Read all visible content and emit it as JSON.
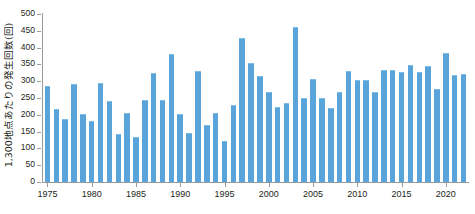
{
  "chart_data": {
    "type": "bar",
    "title": "",
    "subtitle": "",
    "xlabel": "",
    "ylabel": "1,300地点あたりの発生回数(回)",
    "ylim": [
      0,
      500
    ],
    "y_ticks": [
      0,
      50,
      100,
      150,
      200,
      250,
      300,
      350,
      400,
      450,
      500
    ],
    "x_tick_labels": [
      "1975",
      "1980",
      "1985",
      "1990",
      "1995",
      "2000",
      "2005",
      "2010",
      "2015",
      "2020"
    ],
    "grid": false,
    "legend": "none",
    "bar_color": "#5aa4dc",
    "axis_color": "#9a9a9a",
    "text_color": "#231f20",
    "categories": [
      "1975",
      "1976",
      "1977",
      "1978",
      "1979",
      "1980",
      "1981",
      "1982",
      "1983",
      "1984",
      "1985",
      "1986",
      "1987",
      "1988",
      "1989",
      "1990",
      "1991",
      "1992",
      "1993",
      "1994",
      "1995",
      "1996",
      "1997",
      "1998",
      "1999",
      "2000",
      "2001",
      "2002",
      "2003",
      "2004",
      "2005",
      "2006",
      "2007",
      "2008",
      "2009",
      "2010",
      "2011",
      "2012",
      "2013",
      "2014",
      "2015",
      "2016",
      "2017",
      "2018",
      "2019",
      "2020",
      "2021",
      "2022"
    ],
    "values": [
      285,
      218,
      189,
      291,
      203,
      182,
      296,
      240,
      143,
      204,
      134,
      243,
      324,
      245,
      381,
      203,
      146,
      331,
      170,
      205,
      123,
      229,
      428,
      355,
      315,
      267,
      223,
      235,
      462,
      250,
      306,
      250,
      220,
      269,
      330,
      303,
      305,
      267,
      334,
      332,
      326,
      348,
      326,
      346,
      278,
      383,
      318,
      320
    ]
  }
}
